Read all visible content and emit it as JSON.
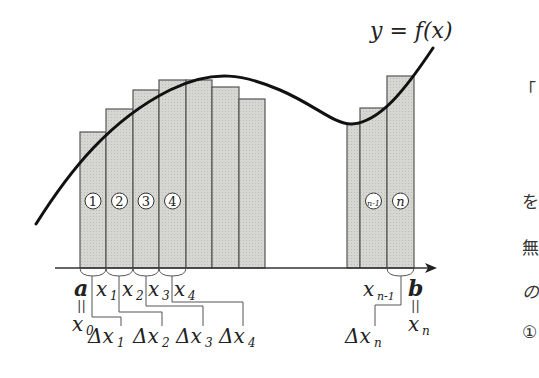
{
  "diagram": {
    "curve_label": "y = f(x)",
    "colors": {
      "bar_fill": "#d4d4d0",
      "bar_stroke": "#555555",
      "curve": "#111111",
      "axis": "#333333",
      "text": "#222222"
    },
    "axis": {
      "y": 268,
      "x_start": 55,
      "x_end": 437
    },
    "bars": [
      {
        "x": 80,
        "w": 26,
        "top": 132,
        "label": "1"
      },
      {
        "x": 106,
        "w": 27,
        "top": 109,
        "label": "2"
      },
      {
        "x": 133,
        "w": 26,
        "top": 90,
        "label": "3"
      },
      {
        "x": 159,
        "w": 27,
        "top": 80,
        "label": "4"
      },
      {
        "x": 186,
        "w": 26,
        "top": 80,
        "label": ""
      },
      {
        "x": 212,
        "w": 27,
        "top": 87,
        "label": ""
      },
      {
        "x": 239,
        "w": 26,
        "top": 99,
        "label": ""
      },
      {
        "x": 347,
        "w": 13,
        "top": 124,
        "label": ""
      },
      {
        "x": 360,
        "w": 27,
        "top": 108,
        "label": "n-1"
      },
      {
        "x": 387,
        "w": 27,
        "top": 76,
        "label": "n"
      }
    ],
    "point_labels": {
      "a": "a",
      "x0": "x",
      "x0_sub": "0",
      "x1": "x",
      "x1_sub": "1",
      "x2": "x",
      "x2_sub": "2",
      "x3": "x",
      "x3_sub": "3",
      "x4": "x",
      "x4_sub": "4",
      "xn1": "x",
      "xn1_sub": "n-1",
      "b": "b",
      "xn": "x",
      "xn_sub": "n",
      "equals": "||"
    },
    "delta_labels": [
      {
        "text": "Δx",
        "sub": "1"
      },
      {
        "text": "Δx",
        "sub": "2"
      },
      {
        "text": "Δx",
        "sub": "3"
      },
      {
        "text": "Δx",
        "sub": "4"
      },
      {
        "text": "Δx",
        "sub": "n"
      }
    ]
  },
  "side_text": {
    "line1": "「",
    "line2": "を",
    "line3": "無",
    "line4": "の",
    "line5": "①"
  }
}
